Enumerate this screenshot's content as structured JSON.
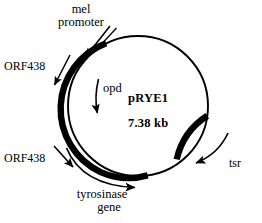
{
  "figure": {
    "kind": "plasmid-map",
    "background_color": "#ffffff",
    "stroke_color": "#000000"
  },
  "plasmid": {
    "name": "pRYE1",
    "size": "7.38 kb",
    "center_x": 138,
    "center_y": 106,
    "radius": 70,
    "backbone_stroke_width": 2
  },
  "features": [
    {
      "id": "mel-promoter",
      "label_line1": "mel",
      "label_line2": "promoter",
      "pointer": "straight-arrow",
      "pointer_direction": "down-right",
      "position": "top-left-outside"
    },
    {
      "id": "orf438-upper",
      "label": "ORF438",
      "pointer": "straight-arrow",
      "pointer_direction": "down-left",
      "position": "left-outside-upper"
    },
    {
      "id": "opd",
      "label": "opd",
      "pointer": "curved-arrow",
      "pointer_direction": "down",
      "position": "inside-upper-left"
    },
    {
      "id": "orf438-lower",
      "label": "ORF438",
      "pointer": "straight-arrow",
      "pointer_direction": "down-right",
      "position": "left-outside-lower"
    },
    {
      "id": "tyrosinase-gene",
      "label_line1": "tyrosinase",
      "label_line2": "gene",
      "pointer": "curved-arrow",
      "pointer_direction": "counterclockwise",
      "position": "bottom-left-outside"
    },
    {
      "id": "tsr",
      "label": "tsr",
      "pointer": "curved-arrow",
      "pointer_direction": "counterclockwise",
      "position": "right-outside-lower"
    }
  ],
  "arcs": [
    {
      "id": "tyrosinase-arc",
      "description": "thick filled arc from upper-left around to bottom",
      "start_angle_deg": 200,
      "end_angle_deg": 95,
      "thickness": 6,
      "color": "#000000"
    },
    {
      "id": "tsr-arc",
      "description": "thick filled arc on lower-right",
      "start_angle_deg": 8,
      "end_angle_deg": 48,
      "thickness": 6,
      "color": "#000000"
    }
  ]
}
